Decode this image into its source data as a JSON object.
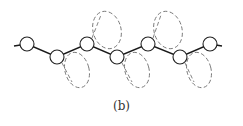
{
  "figure": {
    "caption": "(b)",
    "colors": {
      "bond": "#1a1a1a",
      "atom_stroke": "#222222",
      "orbital": "#777777",
      "background": "#ffffff"
    }
  }
}
